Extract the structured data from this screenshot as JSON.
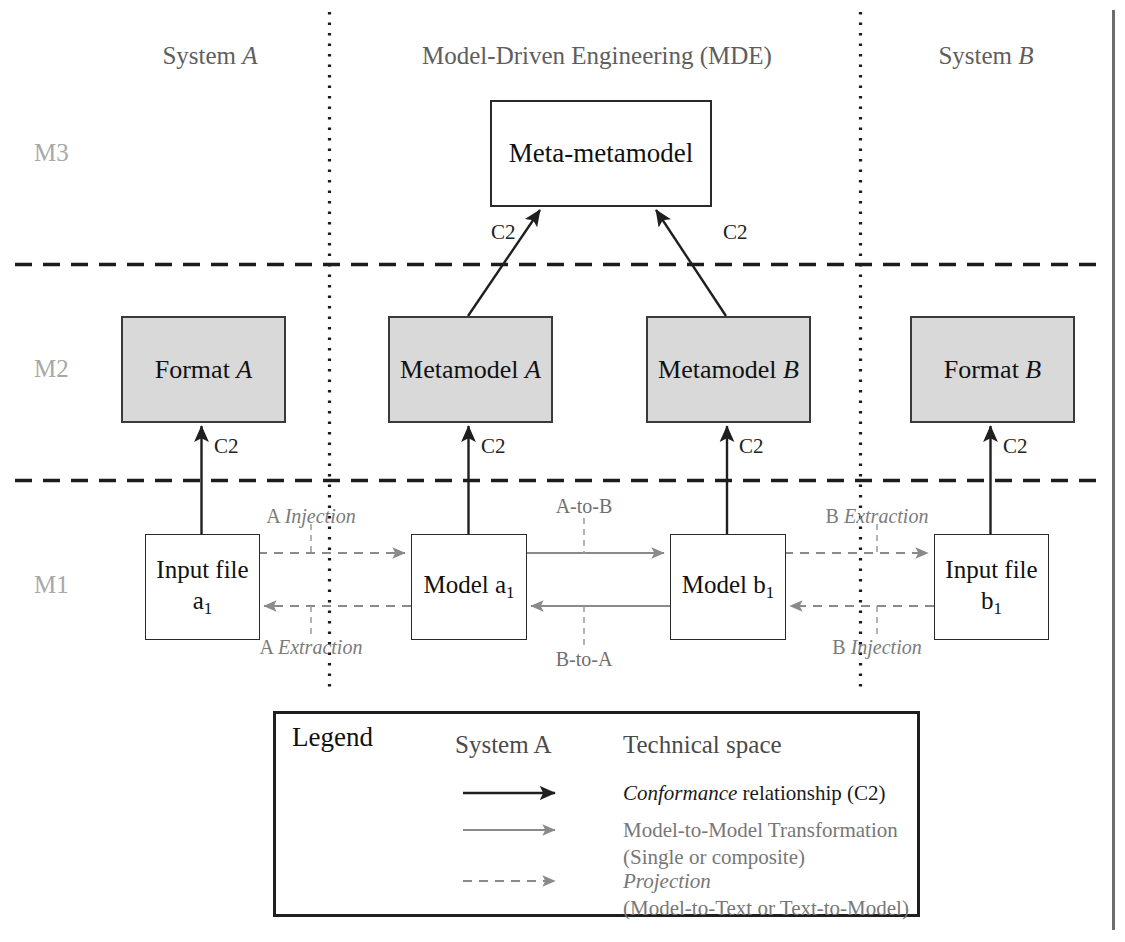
{
  "diagram": {
    "columns": [
      {
        "id": "system-a",
        "label_plain": "System ",
        "label_italic": "A",
        "x": 210
      },
      {
        "id": "mde",
        "label_plain": "Model-Driven Engineering (MDE)",
        "label_italic": "",
        "x": 597
      },
      {
        "id": "system-b",
        "label_plain": "System ",
        "label_italic": "B",
        "x": 986
      }
    ],
    "levels": [
      {
        "id": "m3",
        "label": "M3",
        "y": 153
      },
      {
        "id": "m2",
        "label": "M2",
        "y": 369
      },
      {
        "id": "m1",
        "label": "M1",
        "y": 585
      }
    ],
    "boxes": [
      {
        "id": "meta-metamodel",
        "text": "Meta-metamodel",
        "italic": "",
        "fill": "#ffffff",
        "x": 490,
        "y": 100,
        "w": 218,
        "h": 103,
        "font": 27
      },
      {
        "id": "format-a",
        "text": "Format ",
        "italic": "A",
        "fill": "#d9d9d9",
        "x": 121,
        "y": 316,
        "w": 161,
        "h": 103,
        "font": 26
      },
      {
        "id": "metamodel-a",
        "text": "Metamodel ",
        "italic": "A",
        "fill": "#d9d9d9",
        "x": 388,
        "y": 316,
        "w": 161,
        "h": 103,
        "font": 26
      },
      {
        "id": "metamodel-b",
        "text": "Metamodel ",
        "italic": "B",
        "fill": "#d9d9d9",
        "x": 646,
        "y": 316,
        "w": 161,
        "h": 103,
        "font": 26
      },
      {
        "id": "format-b",
        "text": "Format ",
        "italic": "B",
        "fill": "#d9d9d9",
        "x": 910,
        "y": 316,
        "w": 161,
        "h": 103,
        "font": 26
      },
      {
        "id": "input-file-a1",
        "text": "Input file",
        "sub_line": "a",
        "sub_index": "1",
        "fill": "#ffffff",
        "x": 145,
        "y": 534,
        "w": 113,
        "h": 104,
        "font": 25
      },
      {
        "id": "model-a1",
        "text": "Model a",
        "sub_index": "1",
        "fill": "#ffffff",
        "x": 411,
        "y": 534,
        "w": 114,
        "h": 104,
        "font": 25
      },
      {
        "id": "model-b1",
        "text": "Model b",
        "sub_index": "1",
        "fill": "#ffffff",
        "x": 670,
        "y": 534,
        "w": 114,
        "h": 104,
        "font": 25
      },
      {
        "id": "input-file-b1",
        "text": "Input file",
        "sub_line": "b",
        "sub_index": "1",
        "fill": "#ffffff",
        "x": 934,
        "y": 534,
        "w": 113,
        "h": 104,
        "font": 25
      }
    ],
    "conformance_labels": [
      {
        "id": "c2-mmm-left",
        "text": "C2",
        "x": 491,
        "y": 232
      },
      {
        "id": "c2-mmm-right",
        "text": "C2",
        "x": 723,
        "y": 232
      },
      {
        "id": "c2-format-a",
        "text": "C2",
        "x": 214,
        "y": 446
      },
      {
        "id": "c2-metamodel-a",
        "text": "C2",
        "x": 481,
        "y": 446
      },
      {
        "id": "c2-metamodel-b",
        "text": "C2",
        "x": 739,
        "y": 446
      },
      {
        "id": "c2-format-b",
        "text": "C2",
        "x": 1003,
        "y": 446
      }
    ],
    "edge_labels": [
      {
        "id": "a-injection",
        "plain": "A ",
        "italic": "Injection",
        "x": 311,
        "y": 507
      },
      {
        "id": "a-extraction",
        "plain": "A ",
        "italic": "Extraction",
        "x": 311,
        "y": 638
      },
      {
        "id": "a-to-b",
        "plain": "A-to-B",
        "italic": "",
        "x": 584,
        "y": 501
      },
      {
        "id": "b-to-a",
        "plain": "B-to-A",
        "italic": "",
        "x": 584,
        "y": 650
      },
      {
        "id": "b-extraction",
        "plain": "B ",
        "italic": "Extraction",
        "x": 877,
        "y": 507
      },
      {
        "id": "b-injection",
        "plain": "B ",
        "italic": "Injection",
        "x": 877,
        "y": 638
      }
    ],
    "legend": {
      "title": "Legend",
      "col_system": "System A",
      "col_space": "Technical space",
      "entries": [
        {
          "id": "conformance",
          "arrow": "solid-dark",
          "italic": "Conformance",
          "plain": " relationship (C2)",
          "second_line": ""
        },
        {
          "id": "m2m-transformation",
          "arrow": "solid-gray",
          "italic": "",
          "plain": "Model-to-Model Transformation",
          "second_line": "(Single or composite)"
        },
        {
          "id": "projection",
          "arrow": "dashed-gray",
          "italic": "Projection",
          "plain": "",
          "second_line": "(Model-to-Text or Text-to-Model)"
        }
      ]
    },
    "colors": {
      "box_fill_gray": "#d9d9d9",
      "box_fill_white": "#ffffff",
      "stroke_dark": "#2a2a2a",
      "stroke_gray": "#8c8c8c",
      "text_gray": "#7b7b7b",
      "level_label": "#a8a8a8"
    }
  }
}
